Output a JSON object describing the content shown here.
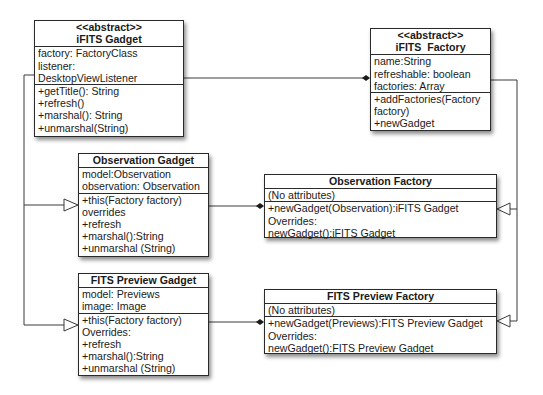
{
  "classes": {
    "ifits_gadget": {
      "stereotype": "<<abstract>>",
      "name": "iFITS Gadget",
      "attributes": [
        "factory: FactoryClass",
        "listener:",
        "DesktopViewListener"
      ],
      "methods": [
        "+getTitle(): String",
        "+refresh()",
        "+marshal(): String",
        "+unmarshal(String)"
      ]
    },
    "ifits_factory": {
      "stereotype": "<<abstract>>",
      "name": "iFITS  Factory",
      "attributes": [
        "name:String",
        "refreshable: boolean",
        "factories: Array"
      ],
      "methods": [
        "+addFactories(Factory",
        "factory)",
        "+newGadget"
      ]
    },
    "observation_gadget": {
      "name": "Observation Gadget",
      "attributes": [
        "model:Observation",
        "observation: Observation"
      ],
      "methods": [
        "+this(Factory factory)",
        "overrides",
        "+refresh",
        "+marshal():String",
        "+unmarshal (String)"
      ]
    },
    "observation_factory": {
      "name": "Observation Factory",
      "attributes": [
        "(No attributes)"
      ],
      "methods": [
        "+newGadget(Observation):iFITS Gadget",
        "Overrides:",
        "newGadget():iFITS Gadget"
      ]
    },
    "fits_preview_gadget": {
      "name": "FITS Preview Gadget",
      "attributes": [
        "model: Previews",
        "image: Image"
      ],
      "methods": [
        "+this(Factory factory)",
        "Overrides:",
        "+refresh",
        "+marshal():String",
        "+unmarshal (String)"
      ]
    },
    "fits_preview_factory": {
      "name": "FITS Preview Factory",
      "attributes": [
        "(No attributes)"
      ],
      "methods": [
        "+newGadget(Previews):FITS Preview Gadget",
        "Overrides:",
        "newGadget():FITS Preview Gadget"
      ]
    }
  },
  "relationships": [
    {
      "type": "composition",
      "from": "iFITS Gadget",
      "to": "iFITS  Factory"
    },
    {
      "type": "generalization",
      "from": "Observation Gadget",
      "to": "iFITS Gadget"
    },
    {
      "type": "generalization",
      "from": "FITS Preview Gadget",
      "to": "iFITS Gadget"
    },
    {
      "type": "composition",
      "from": "Observation Gadget",
      "to": "Observation Factory"
    },
    {
      "type": "composition",
      "from": "FITS Preview Gadget",
      "to": "FITS Preview Factory"
    },
    {
      "type": "generalization",
      "from": "Observation Factory",
      "to": "iFITS  Factory"
    },
    {
      "type": "generalization",
      "from": "FITS Preview Factory",
      "to": "iFITS  Factory"
    }
  ],
  "colors": {
    "line": "#2a2a2a",
    "box_border": "#2a2a2a",
    "background": "#ffffff"
  }
}
